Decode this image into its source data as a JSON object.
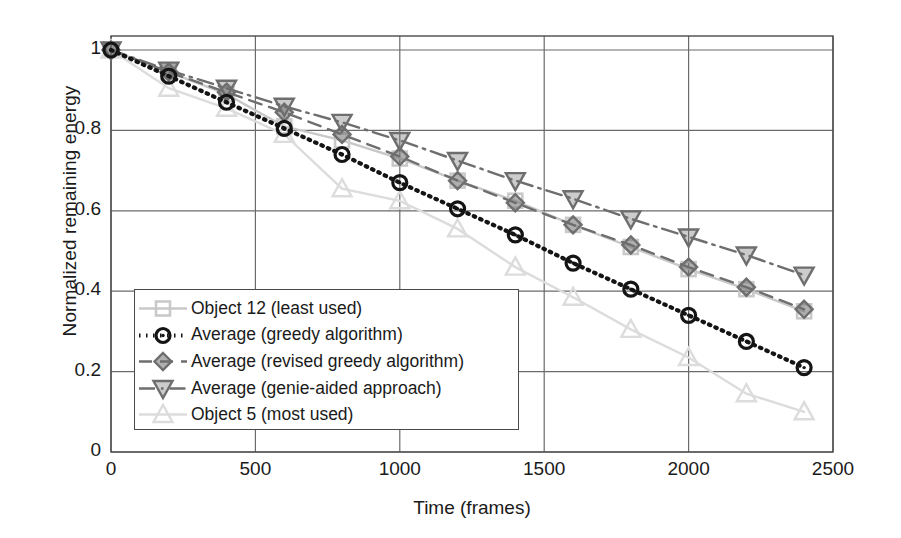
{
  "chart_data": {
    "type": "line",
    "title": "",
    "xlabel": "Time (frames)",
    "ylabel": "Normalized remaining energy",
    "xlim": [
      0,
      2500
    ],
    "ylim": [
      0,
      1
    ],
    "xticks": [
      "0",
      "500",
      "1000",
      "1500",
      "2000",
      "2500"
    ],
    "xtick_values": [
      0,
      500,
      1000,
      1500,
      2000,
      2500
    ],
    "yticks": [
      "0",
      "0.2",
      "0.4",
      "0.6",
      "0.8",
      "1"
    ],
    "ytick_values": [
      0,
      0.2,
      0.4,
      0.6,
      0.8,
      1
    ],
    "grid": true,
    "legend_position": "lower-left-inside",
    "x": [
      0,
      200,
      400,
      600,
      800,
      1000,
      1200,
      1400,
      1600,
      1800,
      2000,
      2200,
      2400
    ],
    "series": [
      {
        "name": "Object 12 (least used)",
        "marker": "square",
        "linestyle": "solid",
        "color": "#c9c9c9",
        "values": [
          1.0,
          0.945,
          0.89,
          0.81,
          0.775,
          0.73,
          0.675,
          0.625,
          0.565,
          0.51,
          0.455,
          0.405,
          0.35
        ]
      },
      {
        "name": "Average (greedy algorithm)",
        "marker": "circle",
        "linestyle": "dotted",
        "color": "#141414",
        "values": [
          1.0,
          0.935,
          0.87,
          0.805,
          0.74,
          0.67,
          0.605,
          0.54,
          0.47,
          0.405,
          0.34,
          0.275,
          0.21
        ]
      },
      {
        "name": "Average (revised greedy algorithm)",
        "marker": "diamond",
        "linestyle": "dashed",
        "color": "#6e6e6e",
        "values": [
          1.0,
          0.945,
          0.895,
          0.845,
          0.79,
          0.735,
          0.675,
          0.62,
          0.565,
          0.515,
          0.46,
          0.41,
          0.355
        ]
      },
      {
        "name": "Average (genie-aided approach)",
        "marker": "triangle-down",
        "linestyle": "dash-dot",
        "color": "#6e6e6e",
        "values": [
          1.0,
          0.95,
          0.905,
          0.86,
          0.82,
          0.775,
          0.725,
          0.675,
          0.63,
          0.58,
          0.535,
          0.49,
          0.44
        ]
      },
      {
        "name": "Object 5 (most used)",
        "marker": "triangle-up",
        "linestyle": "solid",
        "color": "#dcdcdc",
        "values": [
          1.0,
          0.905,
          0.855,
          0.79,
          0.655,
          0.625,
          0.555,
          0.46,
          0.385,
          0.305,
          0.235,
          0.145,
          0.1
        ]
      }
    ]
  },
  "legend": {
    "items": [
      {
        "label": "Object 12 (least used)"
      },
      {
        "label": "Average (greedy algorithm)"
      },
      {
        "label": "Average (revised greedy algorithm)"
      },
      {
        "label": "Average (genie-aided approach)"
      },
      {
        "label": "Object 5 (most used)"
      }
    ]
  },
  "axes": {
    "frame_color": "#4a4a4a",
    "grid_color": "#6b6b6b"
  }
}
